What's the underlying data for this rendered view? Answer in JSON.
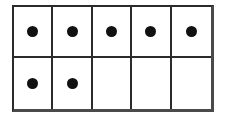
{
  "figure": {
    "kind": "ten-frame",
    "columns": 5,
    "rows": 2,
    "total_cells": 10,
    "filled_count": 7,
    "empty_count": 3,
    "colors": {
      "background": "#ffffff",
      "grid_line": "#2b2b2b",
      "outer_border": "#4a4a4a",
      "dot": "#111111"
    }
  },
  "grid": {
    "rows": [
      {
        "row_index": 1,
        "name": "top-row",
        "cells": [
          {
            "index": 1,
            "filled": true
          },
          {
            "index": 2,
            "filled": true
          },
          {
            "index": 3,
            "filled": true
          },
          {
            "index": 4,
            "filled": true
          },
          {
            "index": 5,
            "filled": true
          }
        ]
      },
      {
        "row_index": 2,
        "name": "bottom-row",
        "cells": [
          {
            "index": 1,
            "filled": true
          },
          {
            "index": 2,
            "filled": true
          },
          {
            "index": 3,
            "filled": false
          },
          {
            "index": 4,
            "filled": false
          },
          {
            "index": 5,
            "filled": false
          }
        ]
      }
    ]
  }
}
